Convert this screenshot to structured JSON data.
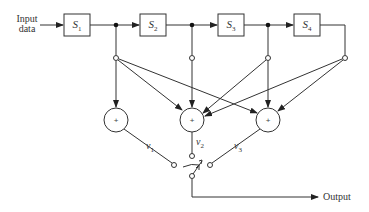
{
  "diagram": {
    "input_label_line1": "Input",
    "input_label_line2": "data",
    "output_label": "Output",
    "stages": [
      {
        "symbol": "S",
        "index": "1"
      },
      {
        "symbol": "S",
        "index": "2"
      },
      {
        "symbol": "S",
        "index": "3"
      },
      {
        "symbol": "S",
        "index": "4"
      }
    ],
    "adders": [
      {
        "symbol": "+",
        "output": "v",
        "index": "1"
      },
      {
        "symbol": "+",
        "output": "v",
        "index": "2"
      },
      {
        "symbol": "+",
        "output": "v",
        "index": "3"
      }
    ],
    "switch": "commutator",
    "colors": {
      "line": "#333333",
      "background": "#ffffff"
    }
  }
}
